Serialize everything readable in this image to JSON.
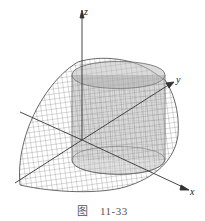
{
  "figure": {
    "caption_prefix": "图",
    "caption_number": "11-33",
    "axes": {
      "x": "x",
      "y": "y",
      "z": "z"
    },
    "colors": {
      "mesh": "#444444",
      "cylinder_fill": "#9a9a9a",
      "axis": "#333333"
    }
  }
}
